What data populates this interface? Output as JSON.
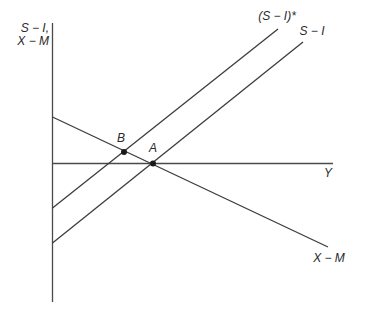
{
  "figure": {
    "width": 366,
    "height": 314,
    "background": "#ffffff",
    "axis_color": "#4a4a4a",
    "curve_color": "#3c3c3c",
    "point_color": "#1a1a1a",
    "text_color": "#2a2a2a",
    "y_axis_label": {
      "line1": "S − I,",
      "line2": "X − M"
    },
    "x_axis_label": "Y",
    "axes": {
      "vertical": {
        "x": 52.5,
        "y1": 23,
        "y2": 302
      },
      "horizontal": {
        "y": 163.5,
        "x1": 52,
        "x2": 333
      }
    },
    "curves": [
      {
        "id": "s-i-star",
        "label": "(S − I)*",
        "from": {
          "x": 52.5,
          "y": 208
        },
        "to": {
          "x": 278,
          "y": 29
        }
      },
      {
        "id": "s-i",
        "label": "S − I",
        "from": {
          "x": 52.5,
          "y": 243
        },
        "to": {
          "x": 303,
          "y": 42
        }
      },
      {
        "id": "x-m",
        "label": "X − M",
        "from": {
          "x": 52.5,
          "y": 117
        },
        "to": {
          "x": 328,
          "y": 247
        }
      }
    ],
    "points": [
      {
        "id": "B",
        "label": "B",
        "x": 124,
        "y": 152,
        "radius": 3
      },
      {
        "id": "A",
        "label": "A",
        "x": 153,
        "y": 163.5,
        "radius": 3
      }
    ],
    "label_positions": {
      "y_axis_label": {
        "x": 49,
        "y": 35
      },
      "x_axis_label": {
        "x": 328,
        "y": 173
      },
      "s_i_star": {
        "x": 277,
        "y": 16
      },
      "s_i": {
        "x": 312,
        "y": 31
      },
      "x_m": {
        "x": 329,
        "y": 258
      },
      "point_b": {
        "x": 121,
        "y": 138
      },
      "point_a": {
        "x": 153,
        "y": 148
      }
    }
  }
}
